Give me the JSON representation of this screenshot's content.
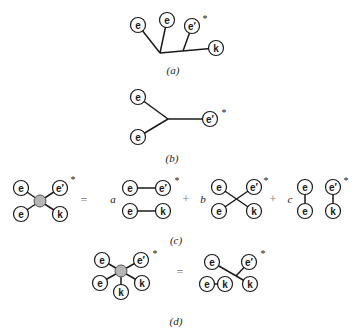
{
  "node_labels": {
    "e": "e",
    "e_prime": "e′",
    "k": "k",
    "asterisk": "*"
  },
  "captions": {
    "a": "(a)",
    "b": "(b)",
    "c": "(c)",
    "d": "(d)"
  },
  "operators": {
    "equals": "=",
    "plus": "+"
  },
  "coefficients": {
    "a": "a",
    "b": "b",
    "c": "c"
  },
  "colors": {
    "ink": "#1a1a1a",
    "blob_fill": "#b5b5b5",
    "operator": "#777777"
  }
}
